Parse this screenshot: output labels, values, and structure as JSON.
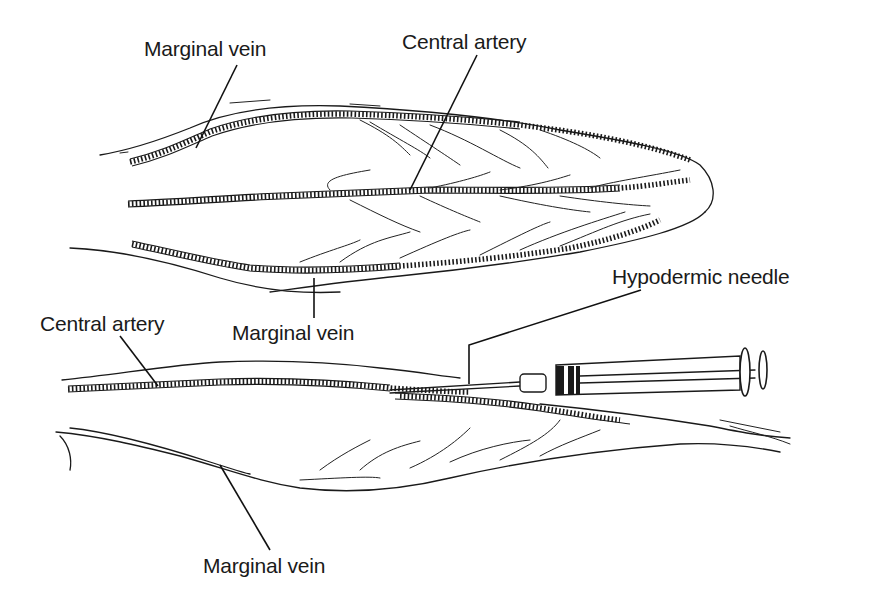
{
  "figure": {
    "labels": {
      "top_marginal_vein": "Marginal vein",
      "top_central_artery": "Central artery",
      "mid_marginal_vein": "Marginal vein",
      "hypodermic_needle": "Hypodermic needle",
      "lower_central_artery": "Central artery",
      "bottom_marginal_vein": "Marginal vein"
    },
    "colors": {
      "line": "#1a1a1a",
      "background": "#ffffff"
    }
  }
}
